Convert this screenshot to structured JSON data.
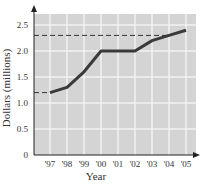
{
  "chart_data": {
    "type": "line",
    "title": "",
    "xlabel": "Year",
    "ylabel": "Dollars (millions)",
    "categories": [
      "'97",
      "'98",
      "'99",
      "'00",
      "'01",
      "'02",
      "'03",
      "'04",
      "'05"
    ],
    "series": [
      {
        "name": "Dollars (millions)",
        "values": [
          1.2,
          1.3,
          1.6,
          2.0,
          2.0,
          2.0,
          2.2,
          2.3,
          2.4
        ]
      }
    ],
    "y_ticks": [
      "0",
      "0.5",
      "1.0",
      "1.5",
      "2.0",
      "2.5"
    ],
    "ylim": [
      0,
      2.75
    ],
    "grid": true,
    "reference_lines": [
      {
        "style": "dashed",
        "y": 1.2,
        "from": "axis",
        "to": "'97"
      },
      {
        "style": "dashed",
        "y": 2.3,
        "from": "axis",
        "to": "'04"
      }
    ],
    "colors": {
      "plot_bg": "#d4d4d4",
      "grid": "#f2f2f2",
      "line": "#3a3a3a",
      "axis": "#222222"
    }
  }
}
